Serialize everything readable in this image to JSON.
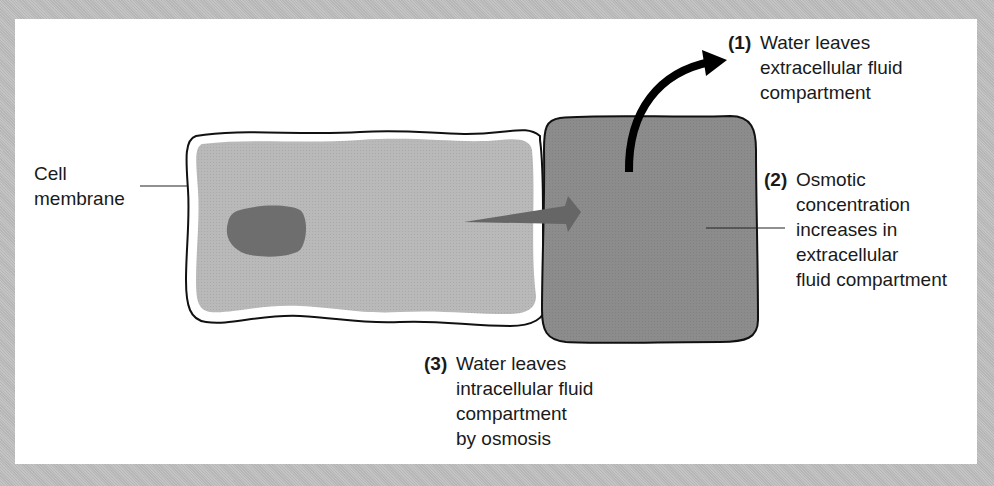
{
  "diagram": {
    "title": "",
    "colors": {
      "background": "#bdbdbd",
      "panel": "#ffffff",
      "intracellular_fill": "#b9b9b9",
      "extracellular_fill": "#8c8c8c",
      "nucleus_fill": "#6e6e6e",
      "outline": "#111111",
      "osmosis_arrow": "#666666",
      "water_arrow": "#000000"
    },
    "labels": {
      "cell_membrane": {
        "lines": [
          "Cell",
          "membrane"
        ]
      },
      "step1": {
        "number": "(1)",
        "lines": [
          "Water leaves",
          "extracellular fluid",
          "compartment"
        ]
      },
      "step2": {
        "number": "(2)",
        "lines": [
          "Osmotic",
          "concentration",
          "increases in",
          "extracellular",
          "fluid compartment"
        ]
      },
      "step3": {
        "number": "(3)",
        "lines": [
          "Water leaves",
          "intracellular fluid",
          "compartment",
          "by osmosis"
        ]
      }
    },
    "nodes": [
      {
        "id": "intracellular-cell",
        "label": "Intracellular fluid compartment (cell)"
      },
      {
        "id": "nucleus",
        "label": "Nucleus"
      },
      {
        "id": "extracellular-compartment",
        "label": "Extracellular fluid compartment"
      }
    ],
    "edges": [
      {
        "from": "intracellular-cell",
        "to": "extracellular-compartment",
        "label": "(3) Water leaves intracellular fluid compartment by osmosis"
      },
      {
        "from": "extracellular-compartment",
        "to": "outside",
        "label": "(1) Water leaves extracellular fluid compartment"
      }
    ]
  }
}
